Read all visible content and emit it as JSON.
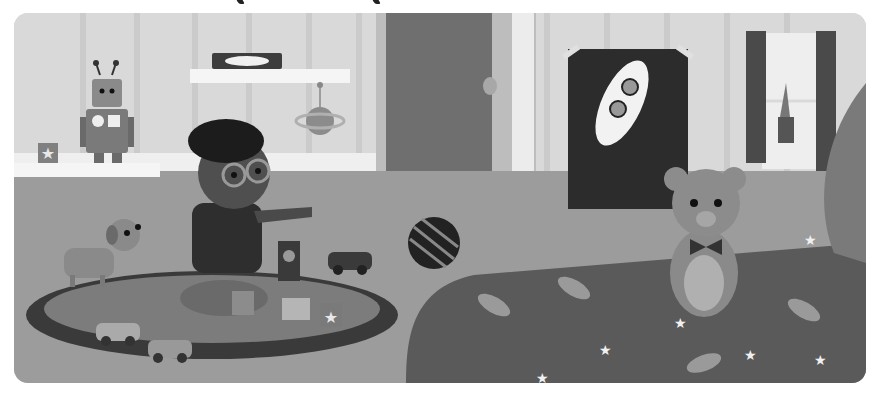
{
  "scene": {
    "title": "",
    "description": "Grayscale children's-book illustration of a kid's bedroom",
    "palette": {
      "wall": "#d9d9d9",
      "wall_stripe": "#c9c9c9",
      "door": "#6e6e6e",
      "floor": "#9a9a9a",
      "rug_outer": "#3c3c3c",
      "rug_inner": "#7a7a7a",
      "bedspread": "#5a5a5a",
      "poster_bg": "#2a2a2a",
      "shelf": "#f4f4f4"
    },
    "elements": [
      {
        "name": "robot-toy",
        "location": "left shelf"
      },
      {
        "name": "star-block",
        "location": "left shelf"
      },
      {
        "name": "book-box",
        "location": "upper shelf"
      },
      {
        "name": "planet-mobile",
        "location": "hanging under upper shelf"
      },
      {
        "name": "boy-with-glasses",
        "location": "seated on rug, pointing right"
      },
      {
        "name": "dog",
        "location": "left, looking up"
      },
      {
        "name": "toy-blocks",
        "location": "rug center"
      },
      {
        "name": "toy-cars",
        "count": 3
      },
      {
        "name": "striped-ball",
        "location": "near door"
      },
      {
        "name": "open-door",
        "location": "center"
      },
      {
        "name": "rocket-poster",
        "location": "right wall"
      },
      {
        "name": "teddy-bear",
        "location": "on bed"
      },
      {
        "name": "window-with-plant",
        "location": "top right"
      },
      {
        "name": "space-bedspread",
        "location": "bottom right"
      }
    ],
    "visible_text": []
  }
}
